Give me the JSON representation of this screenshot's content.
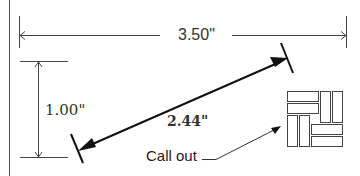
{
  "diagram": {
    "width_dimension": {
      "label": "3.50\""
    },
    "height_dimension": {
      "label": "1.00\""
    },
    "diagonal_dimension": {
      "label": "2.44\""
    },
    "callout": {
      "label": "Call out"
    },
    "colors": {
      "line": "#222222",
      "background": "#ffffff"
    }
  }
}
